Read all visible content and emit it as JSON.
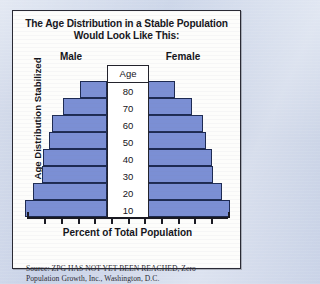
{
  "figure": {
    "title_line1": "The Age Distribution in a Stable Population",
    "title_line2": "Would Look Like This:",
    "y_axis_title": "Age Distribution Stabilized",
    "x_axis_title": "Percent of Total Population",
    "male_header": "Male",
    "female_header": "Female",
    "age_column_header": "Age",
    "source_line1": "Source: ZPG HAS NOT YET BEEN REACHED, Zero Population",
    "source_line2": "Growth, Inc., Washington, D.C."
  },
  "colors": {
    "bar_fill": "#7b8fd4",
    "bar_outline": "#1d2a52",
    "panel_background": "#fdfdfb",
    "panel_border": "#2a2a34",
    "page_background": "#c3cde4",
    "text": "#14141a"
  },
  "chart_data": {
    "type": "bar",
    "title": "The Age Distribution in a Stable Population Would Look Like This:",
    "xlabel": "Percent of Total Population",
    "ylabel": "Age Distribution Stabilized",
    "orientation": "horizontal",
    "layout": "population-pyramid",
    "grid": false,
    "legend": [
      "Male",
      "Female"
    ],
    "legend_position": "top",
    "categories": [
      "80",
      "70",
      "60",
      "50",
      "40",
      "30",
      "20",
      "10"
    ],
    "category_axis_label": "Age",
    "series": [
      {
        "name": "Male",
        "values": [
          2.4,
          3.9,
          4.9,
          5.2,
          5.7,
          5.8,
          6.6,
          7.3
        ]
      },
      {
        "name": "Female",
        "values": [
          2.4,
          3.9,
          4.9,
          5.2,
          5.7,
          5.8,
          6.6,
          7.3
        ]
      }
    ],
    "x_tick_count": 13,
    "x_tick_labels": [],
    "note": "Symmetric idealized stationary population pyramid; bar widths widen from the 80 band down to the 10 band."
  },
  "bar_widths_px": [
    27,
    44,
    55,
    58,
    64,
    65,
    74,
    82
  ],
  "x_tick_positions_px": [
    14,
    31,
    48,
    65,
    81,
    98,
    115,
    131,
    148,
    165,
    181,
    198,
    215
  ]
}
